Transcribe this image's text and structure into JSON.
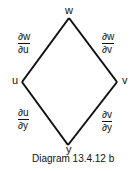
{
  "diagram": {
    "nodes": {
      "top": "w",
      "left": "u",
      "right": "v",
      "bottom": "y"
    },
    "edges": [
      {
        "from": "w",
        "to": "u",
        "num": "∂w",
        "den": "∂u"
      },
      {
        "from": "w",
        "to": "v",
        "num": "∂w",
        "den": "∂v"
      },
      {
        "from": "u",
        "to": "y",
        "num": "∂u",
        "den": "∂y"
      },
      {
        "from": "v",
        "to": "y",
        "num": "∂v",
        "den": "∂y"
      }
    ],
    "caption": "Diagram 13.4.12 b",
    "line_color": "#111111"
  }
}
